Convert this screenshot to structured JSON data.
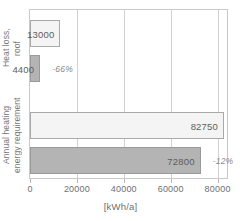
{
  "chart_data": {
    "type": "bar",
    "orientation": "horizontal",
    "title": "",
    "xlabel": "[kWh/a]",
    "ylabel": "",
    "xlim": [
      0,
      84000
    ],
    "xticks": [
      0,
      20000,
      40000,
      60000,
      80000
    ],
    "xtick_labels": [
      "0",
      "20000",
      "40000",
      "60000",
      "80000"
    ],
    "grid": true,
    "legend": "none",
    "categories": [
      "Heat loss, roof",
      "Annual heating energy requirement"
    ],
    "series": [
      {
        "name": "before",
        "style": "light",
        "values": [
          13000,
          82750
        ]
      },
      {
        "name": "after",
        "style": "dark",
        "values": [
          4400,
          72800
        ]
      }
    ],
    "bars": [
      {
        "category": "Heat loss, roof",
        "series": "before",
        "style": "light",
        "value": 13000,
        "label": "13000",
        "pct": ""
      },
      {
        "category": "Heat loss, roof",
        "series": "after",
        "style": "dark",
        "value": 4400,
        "label": "4400",
        "pct": "-66%"
      },
      {
        "category": "Annual heating energy requirement",
        "series": "before",
        "style": "light",
        "value": 82750,
        "label": "82750",
        "pct": ""
      },
      {
        "category": "Annual heating energy requirement",
        "series": "after",
        "style": "dark",
        "value": 72800,
        "label": "72800",
        "pct": "-12%"
      }
    ],
    "annotations": [
      "-66%",
      "-12%"
    ],
    "colors": {
      "light_fill": "#f4f4f4",
      "light_border": "#a9a9a9",
      "dark_fill": "#b4b4b4",
      "dark_border": "#9a9a9a",
      "grid": "#d2d2d2",
      "frame": "#c9c9c9",
      "text": "#6b6b6b"
    }
  },
  "axis": {
    "category_labels": [
      {
        "line1": "Heat loss,",
        "line2": "roof"
      },
      {
        "line1": "Annual heating",
        "line2": "energy requirement"
      }
    ],
    "x_title": "[kWh/a]",
    "x_ticks": [
      "0",
      "20000",
      "40000",
      "60000",
      "80000"
    ]
  }
}
